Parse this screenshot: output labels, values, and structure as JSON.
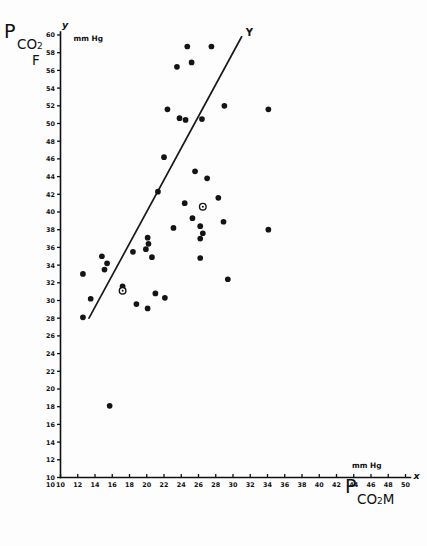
{
  "figure": {
    "background": "#fdfdfd",
    "ink_color": "#141414"
  },
  "y_axis_title": {
    "main": "P",
    "sub": "CO",
    "sub_index": "2",
    "second_line": "F",
    "axis_letter": "y",
    "units": "mm Hg"
  },
  "x_axis_title": {
    "main": "P",
    "sub": "CO",
    "sub_index": "2",
    "second": "M",
    "axis_letter": "x",
    "units": "mm Hg"
  },
  "regression": {
    "label": "Y"
  },
  "chart_data": {
    "type": "scatter",
    "title": "",
    "xlabel": "P CO2 M (mm Hg)",
    "ylabel": "P CO2 F (mm Hg)",
    "xlim": [
      10,
      50
    ],
    "ylim": [
      10,
      60
    ],
    "xticks": [
      10,
      12,
      14,
      16,
      18,
      20,
      22,
      24,
      26,
      28,
      30,
      32,
      34,
      36,
      38,
      40,
      42,
      44,
      46,
      48,
      50
    ],
    "yticks": [
      10,
      12,
      14,
      16,
      18,
      20,
      22,
      24,
      26,
      28,
      30,
      32,
      34,
      36,
      38,
      40,
      42,
      44,
      46,
      48,
      50,
      52,
      54,
      56,
      58,
      60
    ],
    "grid": false,
    "legend": false,
    "series": [
      {
        "name": "filled",
        "marker": "filled-circle",
        "points": [
          [
            24.7,
            58.7
          ],
          [
            27.5,
            58.7
          ],
          [
            23.5,
            56.4
          ],
          [
            25.2,
            56.9
          ],
          [
            22.4,
            51.6
          ],
          [
            23.8,
            50.6
          ],
          [
            24.5,
            50.4
          ],
          [
            26.4,
            50.5
          ],
          [
            29.0,
            52.0
          ],
          [
            34.1,
            51.6
          ],
          [
            22.0,
            46.2
          ],
          [
            25.6,
            44.6
          ],
          [
            27.0,
            43.8
          ],
          [
            21.3,
            42.3
          ],
          [
            24.4,
            41.0
          ],
          [
            28.3,
            41.6
          ],
          [
            25.3,
            39.3
          ],
          [
            28.9,
            38.9
          ],
          [
            23.1,
            38.2
          ],
          [
            26.2,
            38.4
          ],
          [
            26.5,
            37.6
          ],
          [
            26.2,
            37.0
          ],
          [
            20.1,
            37.1
          ],
          [
            20.2,
            36.4
          ],
          [
            19.9,
            35.8
          ],
          [
            18.4,
            35.5
          ],
          [
            20.6,
            34.9
          ],
          [
            26.2,
            34.8
          ],
          [
            14.8,
            35.0
          ],
          [
            15.4,
            34.2
          ],
          [
            15.1,
            33.5
          ],
          [
            34.1,
            38.0
          ],
          [
            12.6,
            33.0
          ],
          [
            29.4,
            32.4
          ],
          [
            17.2,
            31.6
          ],
          [
            21.0,
            30.8
          ],
          [
            22.1,
            30.3
          ],
          [
            13.5,
            30.2
          ],
          [
            18.8,
            29.6
          ],
          [
            20.1,
            29.1
          ],
          [
            12.6,
            28.1
          ],
          [
            15.7,
            18.1
          ]
        ]
      },
      {
        "name": "open",
        "marker": "open-circle",
        "points": [
          [
            26.5,
            40.6
          ],
          [
            17.2,
            31.1
          ]
        ]
      }
    ],
    "regression_line": {
      "x_start": 13.3,
      "y_start": 28.0,
      "x_end": 31.0,
      "y_end": 59.8,
      "label": "Y"
    }
  }
}
